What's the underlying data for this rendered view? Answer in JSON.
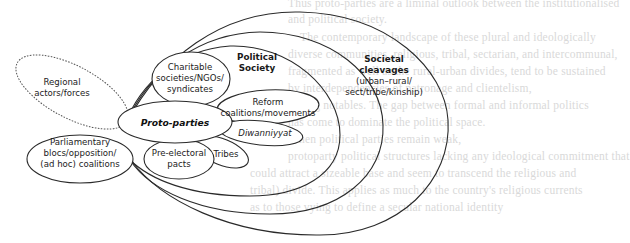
{
  "background_bleed_through": [
    "Thus proto-parties are a liminal outlook between the institutionalised",
    "and political society.",
    "The contemporary landscape of these plural and ideologically",
    "diverse communities, religious, tribal, sectarian, and intercommunal,",
    "fragmented as well as the rural-urban divides, tend to be sustained",
    "by interdependencies of patronage and clientelism,",
    "among notables. The gap between formal and informal politics",
    "has come to dominate the political space.",
    "When political parties remain weak,",
    "protoparty political structures lacking any ideological commitment that",
    "could attract a sizeable base and seem to transcend the religious and",
    "tribal) divide. This applies as much to the country's religious currents",
    "as to those vying to define a secular national identity"
  ],
  "diagram": {
    "center": {
      "label": "Proto-parties",
      "style": "bold-italic"
    },
    "regions": [
      {
        "id": "societal-cleavages",
        "title": "Societal",
        "title2": "cleavages",
        "subtitle": "(urban–rural/",
        "subtitle2": "sect/tribe/kinship)"
      },
      {
        "id": "political-society",
        "title": "Political",
        "title2": "Society"
      }
    ],
    "nodes": [
      {
        "id": "regional",
        "lines": [
          "Regional",
          "actors/forces"
        ],
        "outline": "dashed"
      },
      {
        "id": "charitable",
        "lines": [
          "Charitable",
          "societies/NGOs/",
          "syndicates"
        ],
        "outline": "solid"
      },
      {
        "id": "reform",
        "lines": [
          "Reform",
          "coalitions/movements"
        ],
        "outline": "solid"
      },
      {
        "id": "diwanniyyat",
        "lines": [
          "Diwanniyyat"
        ],
        "outline": "solid",
        "style": "italic"
      },
      {
        "id": "tribes",
        "lines": [
          "Tribes"
        ],
        "outline": "solid"
      },
      {
        "id": "pre-electoral",
        "lines": [
          "Pre-electoral",
          "pacts"
        ],
        "outline": "solid"
      },
      {
        "id": "parliamentary",
        "lines": [
          "Parliamentary",
          "blocs/opposition/",
          "(ad hoc) coalitions"
        ],
        "outline": "solid"
      }
    ]
  }
}
